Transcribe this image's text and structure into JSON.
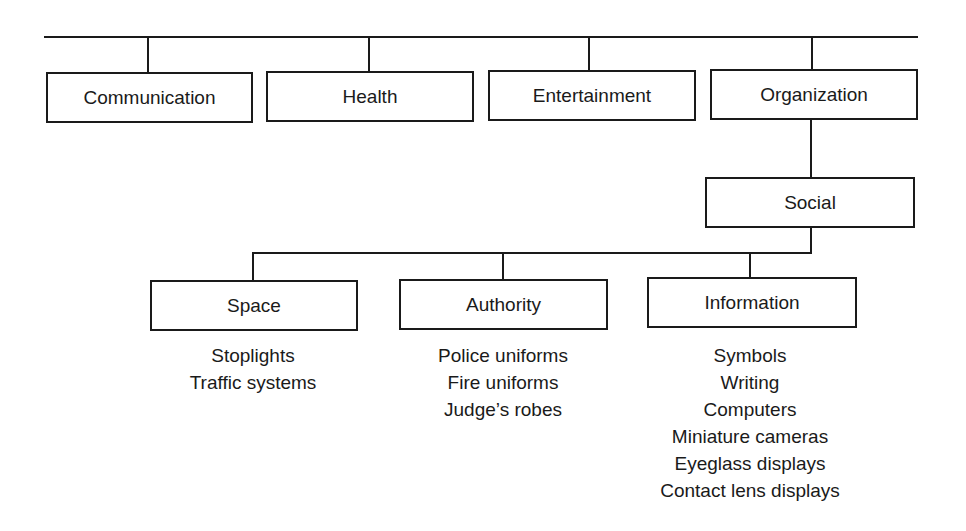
{
  "top_level": [
    {
      "label": "Communication"
    },
    {
      "label": "Health"
    },
    {
      "label": "Entertainment"
    },
    {
      "label": "Organization"
    }
  ],
  "child_of_organization": {
    "label": "Social"
  },
  "social_children": [
    {
      "label": "Space",
      "examples": [
        "Stoplights",
        "Traffic systems"
      ]
    },
    {
      "label": "Authority",
      "examples": [
        "Police uniforms",
        "Fire uniforms",
        "Judge’s robes"
      ]
    },
    {
      "label": "Information",
      "examples": [
        "Symbols",
        "Writing",
        "Computers",
        "Miniature cameras",
        "Eyeglass displays",
        "Contact lens displays"
      ]
    }
  ]
}
